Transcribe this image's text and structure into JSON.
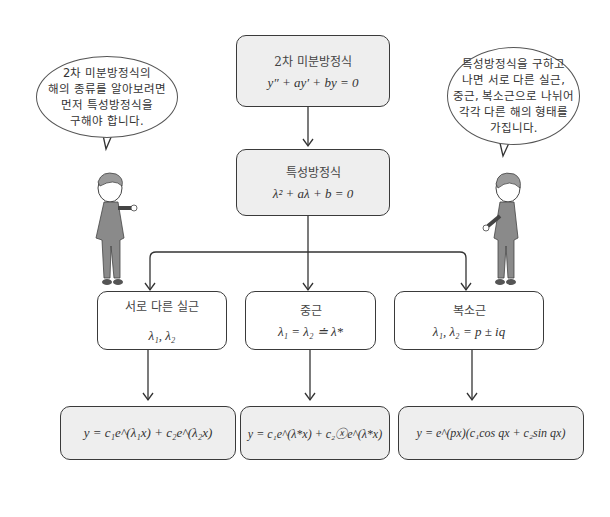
{
  "diagram": {
    "top_box": {
      "title": "2차 미분방정식",
      "equation": "y″ + ay′ + by = 0"
    },
    "char_box": {
      "title": "특성방정식",
      "equation": "λ² + aλ + b = 0"
    },
    "branches": [
      {
        "title": "서로 다른 실근",
        "roots": "λ₁,  λ₂",
        "solution": "y = c₁e^(λ₁x) + c₂e^(λ₂x)"
      },
      {
        "title": "중근",
        "roots": "λ₁ = λ₂ ≐ λ*",
        "solution": "y = c₁e^(λ*x) + c₂ⓧe^(λ*x)"
      },
      {
        "title": "복소근",
        "roots": "λ₁,  λ₂ = p ± iq",
        "solution": "y = e^(px)(c₁cos qx + c₂sin qx)"
      }
    ],
    "speech_left": "2차 미분방정식의\n해의 종류를 알아보려면\n먼저 특성방정식을\n구해야 합니다.",
    "speech_right": "특성방정식을 구하고\n나면 서로 다른 실근,\n중근, 복소근으로 나뉘어\n각각 다른 해의 형태를\n가집니다.",
    "colors": {
      "box_fill": "#eeeeee",
      "box_border": "#3a3a3a",
      "suit": "#8a8a8a"
    }
  }
}
